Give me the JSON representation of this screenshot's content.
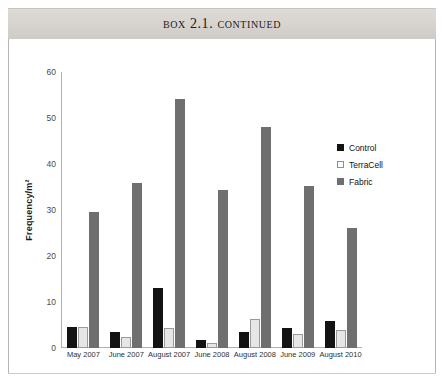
{
  "header": {
    "title": "Box 2.1. Continued"
  },
  "legend": {
    "position": "right",
    "items": [
      {
        "label": "Control",
        "color": "#131313",
        "icon": "square-filled-icon"
      },
      {
        "label": "TerraCell",
        "color": "#ffffff",
        "icon": "square-outline-icon"
      },
      {
        "label": "Fabric",
        "color": "#6f6f6f",
        "icon": "square-gray-icon"
      }
    ]
  },
  "chart_data": {
    "type": "bar",
    "title": "",
    "xlabel": "",
    "ylabel": "Frequency/m²",
    "ylim": [
      0,
      60
    ],
    "yticks": [
      0,
      10,
      20,
      30,
      40,
      50,
      60
    ],
    "grid": false,
    "categories": [
      "May 2007",
      "June 2007",
      "August 2007",
      "June 2008",
      "August 2008",
      "June 2009",
      "August 2010"
    ],
    "series": [
      {
        "name": "Control",
        "color": "#131313",
        "values": [
          4.5,
          3.5,
          13.0,
          1.8,
          3.5,
          4.3,
          5.8
        ]
      },
      {
        "name": "TerraCell",
        "color": "#ffffff",
        "values": [
          4.6,
          2.5,
          4.3,
          1.0,
          6.3,
          3.0,
          4.0
        ]
      },
      {
        "name": "Fabric",
        "color": "#6f6f6f",
        "values": [
          29.5,
          35.8,
          54.2,
          34.3,
          48.0,
          35.3,
          26.0
        ]
      }
    ]
  }
}
